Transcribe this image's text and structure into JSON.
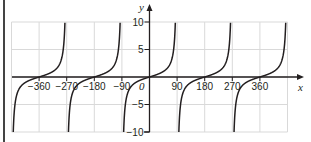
{
  "chart_data": {
    "type": "line",
    "title": "",
    "function": "y = tan x",
    "xlabel": "x",
    "ylabel": "y",
    "origin_label": "0",
    "xlim": [
      -450,
      450
    ],
    "ylim": [
      -10,
      10
    ],
    "grid": true,
    "x_grid_step": 90,
    "y_grid_step": 5,
    "x_ticks": [
      -360,
      -270,
      -180,
      -90,
      90,
      180,
      270,
      360
    ],
    "x_tick_labels": [
      "−360",
      "−270",
      "−180",
      "−90",
      "90",
      "180",
      "270",
      "360"
    ],
    "y_ticks": [
      10,
      5,
      -5,
      -10
    ],
    "y_tick_labels": [
      "10",
      "5",
      "−5",
      "−10"
    ],
    "asymptotes": [
      -450,
      -270,
      -90,
      90,
      270,
      450
    ],
    "series": [
      {
        "name": "tan x",
        "branch_centers": [
          -360,
          -180,
          0,
          180,
          360
        ],
        "color": "#231f20"
      }
    ],
    "sample_points": [
      {
        "x": -360,
        "y": 0
      },
      {
        "x": -315,
        "y": 1
      },
      {
        "x": -405,
        "y": -1
      },
      {
        "x": -180,
        "y": 0
      },
      {
        "x": -135,
        "y": 1
      },
      {
        "x": -225,
        "y": -1
      },
      {
        "x": 0,
        "y": 0
      },
      {
        "x": 45,
        "y": 1
      },
      {
        "x": -45,
        "y": -1
      },
      {
        "x": 180,
        "y": 0
      },
      {
        "x": 225,
        "y": 1
      },
      {
        "x": 135,
        "y": -1
      },
      {
        "x": 360,
        "y": 0
      },
      {
        "x": 405,
        "y": 1
      },
      {
        "x": 315,
        "y": -1
      }
    ],
    "colors": {
      "curve": "#231f20",
      "axis": "#231f20",
      "grid": "#d9d9d9"
    }
  }
}
